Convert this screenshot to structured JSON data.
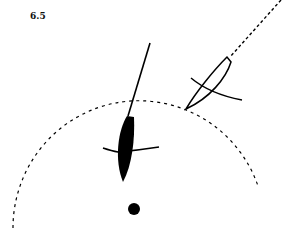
{
  "figure": {
    "label": "6.5",
    "colors": {
      "ink": "#000000",
      "background": "#ffffff"
    },
    "elements": [
      "dashed-circle-arc",
      "black-boat-with-mast-line",
      "outline-boat-with-dashed-course",
      "mark-dot"
    ]
  }
}
